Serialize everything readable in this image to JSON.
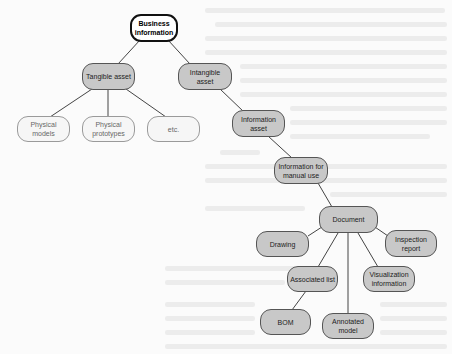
{
  "diagram": {
    "type": "tree",
    "nodes": {
      "business_information": "Business information",
      "tangible_asset": "Tangible asset",
      "intangible_asset": "Intangible asset",
      "physical_models": "Physical models",
      "physical_prototypes": "Physical prototypes",
      "etc": "etc.",
      "information_asset": "Information asset",
      "information_for_manual_use": "Information for manual use",
      "document": "Document",
      "drawing": "Drawing",
      "inspection_report": "Inspection report",
      "associated_list": "Associated list",
      "visualization_information": "Visualization information",
      "bom": "BOM",
      "annotated_model": "Annotated model"
    },
    "edges": [
      [
        "Business information",
        "Tangible asset"
      ],
      [
        "Business information",
        "Intangible asset"
      ],
      [
        "Tangible asset",
        "Physical models"
      ],
      [
        "Tangible asset",
        "Physical prototypes"
      ],
      [
        "Tangible asset",
        "etc."
      ],
      [
        "Intangible asset",
        "Information asset"
      ],
      [
        "Information asset",
        "Information for manual use"
      ],
      [
        "Information for manual use",
        "Document"
      ],
      [
        "Document",
        "Drawing"
      ],
      [
        "Document",
        "Inspection report"
      ],
      [
        "Document",
        "Associated list"
      ],
      [
        "Document",
        "Visualization information"
      ],
      [
        "Document",
        "Annotated model"
      ],
      [
        "Associated list",
        "BOM"
      ]
    ],
    "colors": {
      "root_fill": "#ffffff",
      "node_fill": "#c8c8c8",
      "light_fill": "#f6f6f6",
      "edge": "#444444"
    }
  }
}
